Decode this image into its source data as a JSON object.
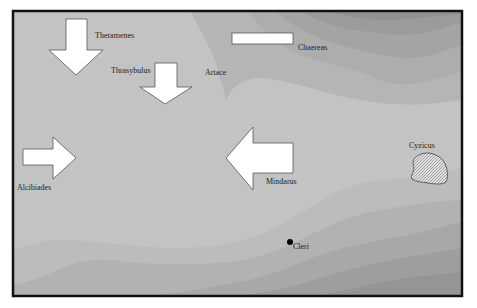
{
  "map": {
    "title": "",
    "colors": {
      "frame": "#111111",
      "land_light": "#c2c2c2",
      "sea_band_1": "#b8b8b8",
      "sea_band_2": "#adadad",
      "sea_band_3": "#a3a3a3",
      "sea_band_4": "#999999",
      "sea_band_5": "#8f8f8f",
      "artace_region": "#b3b3b3",
      "arrow_fill": "#ffffff",
      "arrow_stroke": "#555555",
      "cyzicus_fill": "#d8d8d8"
    },
    "labels": {
      "theramenes": "Theramenes",
      "thrasybulus": "Thrasybulus",
      "artace": "Artace",
      "chaereas": "Chaereas",
      "alcibiades": "Alcibiades",
      "mindarus": "Mindarus",
      "cyzicus": "Cyzicus",
      "cleri": "Cleri"
    },
    "forces": [
      {
        "name": "Theramenes",
        "direction": "south"
      },
      {
        "name": "Thrasybulus",
        "direction": "south"
      },
      {
        "name": "Alcibiades",
        "direction": "east"
      },
      {
        "name": "Mindarus",
        "direction": "west"
      },
      {
        "name": "Chaereas",
        "direction": "stationary"
      }
    ],
    "places": [
      "Artace",
      "Cyzicus",
      "Cleri"
    ]
  }
}
